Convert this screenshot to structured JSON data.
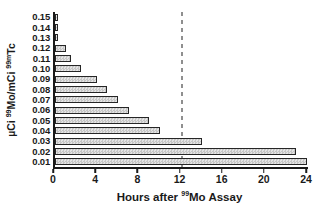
{
  "chart_data": {
    "type": "bar",
    "orientation": "horizontal",
    "title": "",
    "xlabel_parts": [
      {
        "t": "Hours after "
      },
      {
        "t": "99",
        "sup": true
      },
      {
        "t": "Mo Assay"
      }
    ],
    "ylabel_parts": [
      {
        "t": "µCi "
      },
      {
        "t": "99",
        "sup": true
      },
      {
        "t": "Mo/mCi "
      },
      {
        "t": "99m",
        "sup": true
      },
      {
        "t": "Tc"
      }
    ],
    "categories": [
      "0.15",
      "0.14",
      "0.13",
      "0.12",
      "0.11",
      "0.10",
      "0.09",
      "0.08",
      "0.07",
      "0.06",
      "0.05",
      "0.04",
      "0.03",
      "0.02",
      "0.01"
    ],
    "values": [
      0.1,
      0.25,
      0.3,
      1.0,
      1.5,
      2.5,
      4.0,
      4.9,
      6.0,
      7.0,
      8.9,
      10.0,
      13.9,
      22.9,
      23.9
    ],
    "values_unit": "hours",
    "xlim": [
      0,
      24
    ],
    "x_ticks": [
      "0",
      "4",
      "8",
      "12",
      "16",
      "20",
      "24"
    ],
    "reference_line_x": 12,
    "grid": false,
    "legend": null,
    "colors": {
      "background": "#ffffff",
      "bar_fill_light": "#e4e4e4",
      "bar_fill_pattern": "#c6c6c6",
      "bar_border": "#262626",
      "axis": "#1a1a1a",
      "text": "#1a1a1a",
      "reference_line": "#8f8f8f"
    }
  }
}
